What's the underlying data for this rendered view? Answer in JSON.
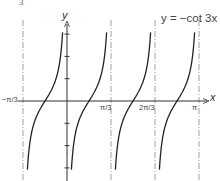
{
  "figure": {
    "number_label": "3"
  },
  "chart_data": {
    "type": "line",
    "title": "y = −cot 3x",
    "function": "y = -cot(3x)",
    "xlabel": "x",
    "ylabel": "y",
    "x_ticks": [
      {
        "label": "−π/3",
        "value": -1.0472
      },
      {
        "label": "π/3",
        "value": 1.0472
      },
      {
        "label": "2π/3",
        "value": 2.0944
      },
      {
        "label": "π",
        "value": 3.1416
      }
    ],
    "y_ticks": [
      -3,
      -2,
      -1,
      1,
      2,
      3
    ],
    "y_tick_labels_shown": false,
    "asymptotes_x": [
      -1.0472,
      0,
      1.0472,
      2.0944,
      3.1416
    ],
    "asymptote_style": "dash-dot",
    "zeros_x": [
      -0.5236,
      0.5236,
      1.5708,
      2.618
    ],
    "branches": [
      {
        "from": "−π/3",
        "to": "0",
        "zero": "−π/6"
      },
      {
        "from": "0",
        "to": "π/3",
        "zero": "π/6"
      },
      {
        "from": "π/3",
        "to": "2π/3",
        "zero": "π/2"
      },
      {
        "from": "2π/3",
        "to": "π",
        "zero": "5π/6"
      }
    ],
    "xlim": [
      -1.1,
      3.3
    ],
    "ylim": [
      -3.2,
      3.2
    ],
    "grid": false,
    "legend": "none",
    "line_color": "#222222",
    "axis_color": "#333333",
    "asymptote_color": "#888888"
  },
  "layout": {
    "origin_px": [
      67,
      101
    ],
    "px_per_pi_over_3": 44,
    "px_per_unit_y": 22.3,
    "curve_y_clip": [
      -3.08,
      3.15
    ]
  }
}
